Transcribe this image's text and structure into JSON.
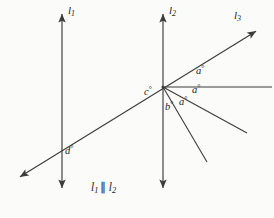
{
  "figure": {
    "background_color": "#fbfbfa",
    "stroke_color": "#3c3c3c",
    "text_color": "#1b1b1b"
  },
  "lines": [
    {
      "id": "l1",
      "label": "l",
      "subscript": "1",
      "kind": "vertical-double-arrow",
      "x": 62,
      "y_top": 12,
      "y_bottom": 190
    },
    {
      "id": "l2",
      "label": "l",
      "subscript": "2",
      "kind": "vertical-double-arrow",
      "x": 163,
      "y_top": 12,
      "y_bottom": 190
    },
    {
      "id": "l3",
      "label": "l",
      "subscript": "3",
      "kind": "transversal-double-arrow",
      "x1": 18,
      "y1": 178,
      "x2": 258,
      "y2": 30
    }
  ],
  "vertex": {
    "x": 163,
    "y": 87
  },
  "rays": [
    {
      "id": "ray-horizontal",
      "x1": 163,
      "y1": 87,
      "x2": 272,
      "y2": 87
    },
    {
      "id": "ray-middle",
      "x1": 163,
      "y1": 87,
      "x2": 247,
      "y2": 133
    },
    {
      "id": "ray-steep",
      "x1": 163,
      "y1": 87,
      "x2": 207,
      "y2": 162
    }
  ],
  "angle_labels": [
    {
      "id": "angle-a-upper",
      "text": "a",
      "degree": "°",
      "x": 197,
      "y": 71
    },
    {
      "id": "angle-a-middle",
      "text": "a",
      "degree": "°",
      "x": 193,
      "y": 90
    },
    {
      "id": "angle-a-lower",
      "text": "a",
      "degree": "°",
      "x": 180,
      "y": 102
    },
    {
      "id": "angle-b",
      "text": "b",
      "degree": "°",
      "x": 166,
      "y": 107
    },
    {
      "id": "angle-c",
      "text": "c",
      "degree": "°",
      "x": 146,
      "y": 92
    },
    {
      "id": "angle-d",
      "text": "d",
      "degree": "°",
      "x": 66,
      "y": 151
    }
  ],
  "line_labels": [
    {
      "id": "label-l1",
      "base": "l",
      "sub": "1",
      "x": 68,
      "y": 11
    },
    {
      "id": "label-l2",
      "base": "l",
      "sub": "2",
      "x": 169,
      "y": 11
    },
    {
      "id": "label-l3",
      "base": "l",
      "sub": "3",
      "x": 235,
      "y": 16
    }
  ],
  "caption": {
    "id": "caption-parallel",
    "left_base": "l",
    "left_sub": "1",
    "parallel_symbol": "∥",
    "right_base": "l",
    "right_sub": "2",
    "x": 92,
    "y": 188
  }
}
